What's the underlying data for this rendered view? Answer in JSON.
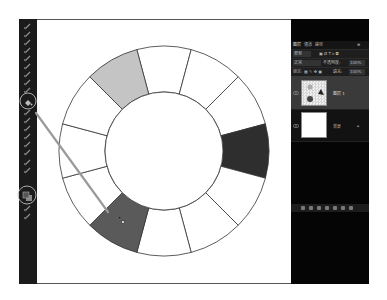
{
  "app": "Photoshop",
  "toolbar": {
    "tools": [
      {
        "name": "move-tool-icon",
        "y": 4
      },
      {
        "name": "marquee-tool-icon",
        "y": 12
      },
      {
        "name": "lasso-tool-icon",
        "y": 20
      },
      {
        "name": "magic-wand-tool-icon",
        "y": 28
      },
      {
        "name": "crop-tool-icon",
        "y": 36
      },
      {
        "name": "eyedropper-tool-icon",
        "y": 44
      },
      {
        "name": "healing-brush-tool-icon",
        "y": 52
      },
      {
        "name": "brush-tool-icon",
        "y": 60
      },
      {
        "name": "clone-stamp-tool-icon",
        "y": 68
      },
      {
        "name": "paint-bucket-tool-icon",
        "y": 80
      },
      {
        "name": "eraser-tool-icon",
        "y": 90
      },
      {
        "name": "dodge-tool-icon",
        "y": 98
      },
      {
        "name": "pen-tool-icon",
        "y": 106
      },
      {
        "name": "type-tool-icon",
        "y": 114
      },
      {
        "name": "path-selection-tool-icon",
        "y": 122
      },
      {
        "name": "shape-tool-icon",
        "y": 130
      },
      {
        "name": "hand-tool-icon",
        "y": 140
      },
      {
        "name": "zoom-tool-icon",
        "y": 148
      },
      {
        "name": "foreground-background-color-icon",
        "y": 172
      },
      {
        "name": "quick-mask-icon",
        "y": 186
      },
      {
        "name": "screen-mode-icon",
        "y": 194
      }
    ],
    "highlighted": [
      "paint-bucket-tool-icon",
      "foreground-background-color-icon"
    ]
  },
  "canvas": {
    "color_wheel": {
      "center": [
        164,
        151
      ],
      "outer_radius": 105,
      "inner_radius": 59,
      "segments": 12,
      "segment_fills": [
        "#ffffff",
        "#ffffff",
        "#ffffff",
        "#2e2e2e",
        "#ffffff",
        "#ffffff",
        "#ffffff",
        "#5a5a5a",
        "#ffffff",
        "#ffffff",
        "#ffffff",
        "#c4c4c4"
      ],
      "stroke": "#333333"
    },
    "callout_line": {
      "from": [
        36,
        113
      ],
      "to": [
        108,
        212
      ],
      "color": "#9a9a9a"
    },
    "cursor": "paint-bucket"
  },
  "layers_panel": {
    "tabs": [
      "图层",
      "通道",
      "路径"
    ],
    "kind_filter": "类型",
    "blend_mode": "正常",
    "opacity_label": "不透明度:",
    "opacity_value": "100%",
    "lock_label": "锁定:",
    "fill_label": "填充:",
    "fill_value": "100%",
    "layers": [
      {
        "name": "图层 1",
        "selected": true,
        "thumb": "transparent-with-dots"
      },
      {
        "name": "背景",
        "selected": false,
        "thumb": "white",
        "locked": true
      }
    ]
  },
  "colors": {
    "toolbar_bg": "#1b1b1b",
    "panel_bg": "#050505",
    "selected_layer_bg": "#3a3a3a",
    "highlight_circle": "#bbbbbb"
  }
}
